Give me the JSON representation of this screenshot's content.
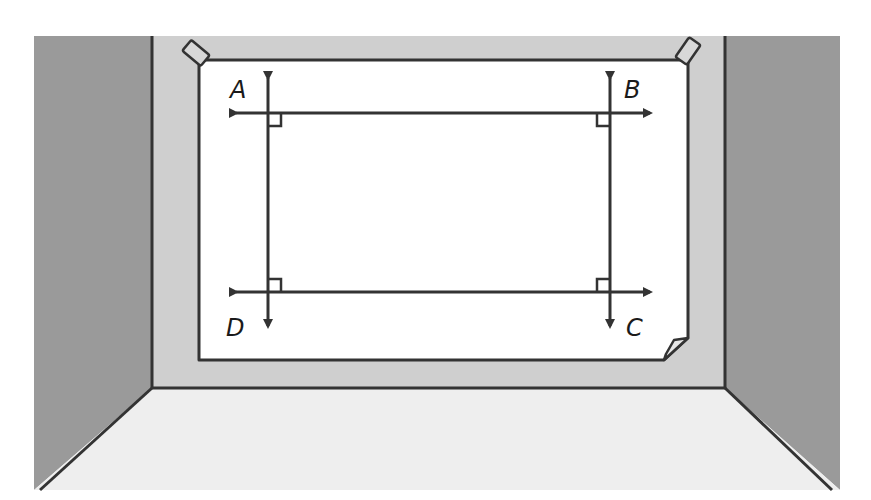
{
  "scene": {
    "description": "Poster taped to a wall showing rectangle ABCD formed by two pairs of perpendicular lines",
    "colors": {
      "side_walls": "#9a9a9a",
      "back_wall": "#cfcfcf",
      "floor": "#eeeeee",
      "poster": "#ffffff",
      "outline": "#333333",
      "tape": "#d8d8d8"
    }
  },
  "diagram": {
    "points": [
      {
        "label": "A",
        "x": 230,
        "y": 98
      },
      {
        "label": "B",
        "x": 624,
        "y": 98
      },
      {
        "label": "C",
        "x": 626,
        "y": 336
      },
      {
        "label": "D",
        "x": 226,
        "y": 336
      }
    ],
    "lines": [
      {
        "name": "line-AB",
        "orientation": "horizontal",
        "y": 113,
        "x1": 228,
        "x2": 658
      },
      {
        "name": "line-DC",
        "orientation": "horizontal",
        "y": 292,
        "x1": 228,
        "x2": 658
      },
      {
        "name": "line-AD",
        "orientation": "vertical",
        "x": 268,
        "y1": 70,
        "y2": 333
      },
      {
        "name": "line-BC",
        "orientation": "vertical",
        "x": 610,
        "y1": 70,
        "y2": 333
      }
    ],
    "right_angle_marks": 4
  }
}
